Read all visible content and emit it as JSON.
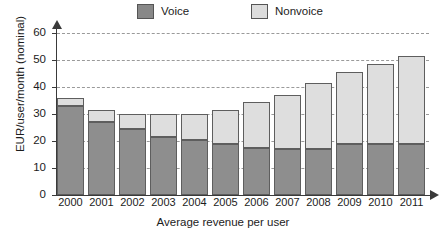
{
  "chart_data": {
    "type": "bar",
    "title": "",
    "xlabel": "Average revenue per user",
    "ylabel": "EUR/user/month (nominal)",
    "categories": [
      "2000",
      "2001",
      "2002",
      "2003",
      "2004",
      "2005",
      "2006",
      "2007",
      "2008",
      "2009",
      "2010",
      "2011"
    ],
    "series": [
      {
        "name": "Voice",
        "color": "#8e8e8e",
        "values": [
          32.8,
          27.2,
          24.3,
          21.6,
          20.2,
          18.8,
          17.3,
          17.2,
          17.2,
          18.9,
          18.9,
          18.9
        ]
      },
      {
        "name": "Nonvoice",
        "color": "#dedede",
        "values": [
          3.2,
          4.2,
          5.6,
          8.3,
          9.7,
          12.7,
          17.0,
          20.0,
          24.2,
          26.8,
          29.7,
          32.5
        ]
      }
    ],
    "totals": [
      36.0,
      31.4,
      29.9,
      29.9,
      29.9,
      31.5,
      34.3,
      37.2,
      41.4,
      45.7,
      48.6,
      51.4
    ],
    "stacked": true,
    "ylim": [
      0,
      60
    ],
    "yticks": [
      0,
      10,
      20,
      30,
      40,
      50,
      60
    ],
    "ytick_labels": [
      "0",
      "10",
      "20",
      "30",
      "40",
      "50",
      "60"
    ],
    "grid": "horizontal-dashed",
    "legend_position": "top-center",
    "legend": [
      {
        "label": "Voice",
        "swatch": "voice-swatch"
      },
      {
        "label": "Nonvoice",
        "swatch": "nonvoice-swatch"
      }
    ]
  }
}
